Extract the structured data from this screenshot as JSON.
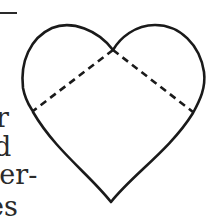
{
  "text_fragments": [
    {
      "text": "r",
      "top": 104,
      "left": -4
    },
    {
      "text": "d",
      "top": 133,
      "left": -6
    },
    {
      "text": "per-",
      "top": 161,
      "left": -18
    },
    {
      "text": "es",
      "top": 193,
      "left": -12
    }
  ],
  "figure": {
    "shape": "heart",
    "outline_color": "#1a1a1a",
    "dashed_lines": 2
  }
}
